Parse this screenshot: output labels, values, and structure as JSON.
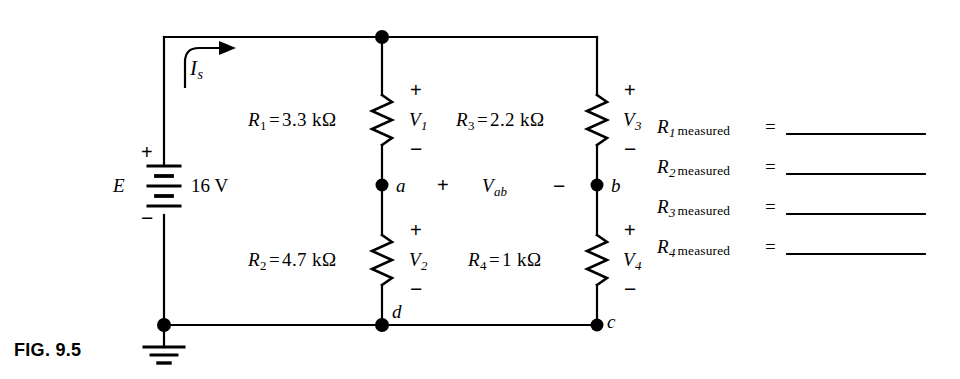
{
  "figure": {
    "caption": "FIG. 9.5"
  },
  "source": {
    "symbol_label": "E",
    "value": "16 V",
    "plus": "+",
    "minus": "−",
    "current_label": {
      "base": "I",
      "sub": "s"
    }
  },
  "resistors": [
    {
      "name": "R1",
      "label_base": "R",
      "label_sub": "1",
      "eq": "=",
      "value": "3.3 kΩ",
      "voltage_base": "V",
      "voltage_sub": "1",
      "plus": "+",
      "minus": "−"
    },
    {
      "name": "R2",
      "label_base": "R",
      "label_sub": "2",
      "eq": "=",
      "value": "4.7 kΩ",
      "voltage_base": "V",
      "voltage_sub": "2",
      "plus": "+",
      "minus": "−"
    },
    {
      "name": "R3",
      "label_base": "R",
      "label_sub": "3",
      "eq": "=",
      "value": "2.2 kΩ",
      "voltage_base": "V",
      "voltage_sub": "3",
      "plus": "+",
      "minus": "−"
    },
    {
      "name": "R4",
      "label_base": "R",
      "label_sub": "4",
      "eq": "=",
      "value": "1 kΩ",
      "voltage_base": "V",
      "voltage_sub": "4",
      "plus": "+",
      "minus": "−"
    }
  ],
  "nodes": {
    "a": "a",
    "b": "b",
    "c": "c",
    "d": "d"
  },
  "bridge_voltage": {
    "plus": "+",
    "base": "V",
    "sub": "ab",
    "minus": "−"
  },
  "measurements": {
    "rows": [
      {
        "base": "R",
        "sub": "1",
        "word": "measured",
        "eq": "=",
        "value": ""
      },
      {
        "base": "R",
        "sub": "2",
        "word": "measured",
        "eq": "=",
        "value": ""
      },
      {
        "base": "R",
        "sub": "3",
        "word": "measured",
        "eq": "=",
        "value": ""
      },
      {
        "base": "R",
        "sub": "4",
        "word": "measured",
        "eq": "=",
        "value": ""
      }
    ]
  },
  "colors": {
    "ink": "#000000",
    "paper": "#ffffff"
  }
}
